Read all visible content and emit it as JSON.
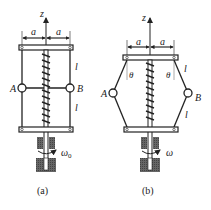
{
  "figures": [
    {
      "id": "a",
      "caption": "(a)",
      "axis_label": "z",
      "dimension_left": "a",
      "dimension_right": "a",
      "rod_length_upper": "l",
      "rod_length_lower": "l",
      "point_left": "A",
      "point_right": "B",
      "angular_velocity": "ω",
      "angular_velocity_sub": "0"
    },
    {
      "id": "b",
      "caption": "(b)",
      "axis_label": "z",
      "dimension_left": "a",
      "dimension_right": "a",
      "rod_length_upper": "l",
      "rod_length_lower": "l",
      "angle_left": "θ",
      "angle_right": "θ",
      "point_left": "A",
      "point_right": "B",
      "angular_velocity": "ω"
    }
  ],
  "colors": {
    "line": "#222222",
    "hatch": "#555555",
    "background": "#ffffff"
  }
}
